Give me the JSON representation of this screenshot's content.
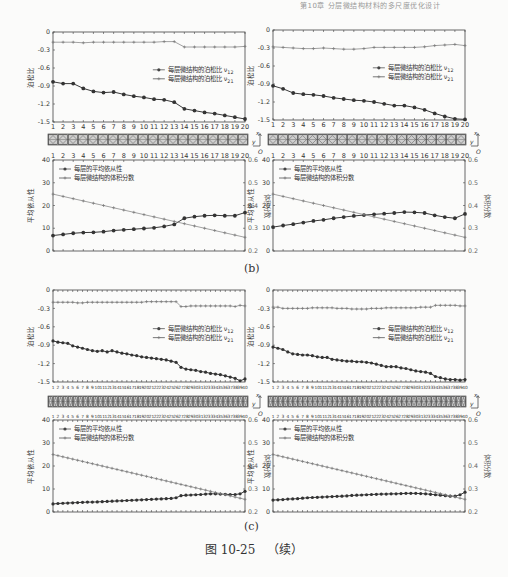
{
  "header": {
    "running_head": "第10章 分层微结构材料的多尺度优化设计"
  },
  "panels": [
    {
      "id": "b",
      "label": "(b)"
    },
    {
      "id": "c",
      "label": "(c)"
    }
  ],
  "caption": {
    "figure_number": "图 10-25",
    "suffix": "（续）"
  },
  "legend": {
    "poisson_v12": "每层微结构的泊松比 ν",
    "poisson_v12_sub": "12",
    "poisson_v21": "每层微结构的泊松比 ν",
    "poisson_v21_sub": "21",
    "avg_compliance": "每层的平均依从性",
    "volume_fraction": "每层微结构的体积分数"
  },
  "axis_labels": {
    "poisson": "泊松比",
    "compliance": "平均依从性",
    "volume": "体积分数"
  },
  "chart_data": [
    {
      "panel": "b-left-top",
      "type": "line",
      "title": "",
      "xlabel": "",
      "ylabel": "泊松比",
      "x": [
        1,
        2,
        3,
        4,
        5,
        6,
        7,
        8,
        9,
        10,
        11,
        12,
        13,
        14,
        15,
        16,
        17,
        18,
        19,
        20
      ],
      "ylim": [
        -1.5,
        0
      ],
      "yticks": [
        0,
        -0.3,
        -0.6,
        -0.9,
        -1.2,
        -1.5
      ],
      "series": [
        {
          "name": "每层微结构的泊松比 ν12",
          "marker": "filled-circle",
          "values": [
            -0.83,
            -0.86,
            -0.86,
            -0.94,
            -0.99,
            -1.01,
            -1.0,
            -1.04,
            -1.07,
            -1.09,
            -1.12,
            -1.13,
            -1.17,
            -1.28,
            -1.31,
            -1.34,
            -1.36,
            -1.39,
            -1.42,
            -1.45
          ]
        },
        {
          "name": "每层微结构的泊松比 ν21",
          "marker": "plus",
          "values": [
            -0.17,
            -0.17,
            -0.17,
            -0.18,
            -0.17,
            -0.17,
            -0.17,
            -0.17,
            -0.17,
            -0.17,
            -0.17,
            -0.16,
            -0.16,
            -0.25,
            -0.25,
            -0.25,
            -0.25,
            -0.25,
            -0.25,
            -0.24
          ]
        }
      ],
      "legend_position": "center-right"
    },
    {
      "panel": "b-right-top",
      "type": "line",
      "xlabel": "",
      "ylabel": "泊松比",
      "x": [
        1,
        2,
        3,
        4,
        5,
        6,
        7,
        8,
        9,
        10,
        11,
        12,
        13,
        14,
        15,
        16,
        17,
        18,
        19,
        20
      ],
      "ylim": [
        -1.5,
        0
      ],
      "yticks": [
        0,
        -0.3,
        -0.6,
        -0.9,
        -1.2,
        -1.5
      ],
      "series": [
        {
          "name": "每层微结构的泊松比 ν12",
          "marker": "filled-circle",
          "values": [
            -0.93,
            -0.98,
            -1.05,
            -1.07,
            -1.08,
            -1.1,
            -1.13,
            -1.15,
            -1.17,
            -1.18,
            -1.2,
            -1.23,
            -1.26,
            -1.26,
            -1.29,
            -1.33,
            -1.39,
            -1.44,
            -1.48,
            -1.49
          ]
        },
        {
          "name": "每层微结构的泊松比 ν21",
          "marker": "plus",
          "values": [
            -0.28,
            -0.29,
            -0.3,
            -0.31,
            -0.31,
            -0.3,
            -0.31,
            -0.32,
            -0.32,
            -0.31,
            -0.29,
            -0.29,
            -0.29,
            -0.29,
            -0.29,
            -0.28,
            -0.26,
            -0.25,
            -0.24,
            -0.26
          ]
        }
      ],
      "legend_position": "center-right"
    },
    {
      "panel": "b-left-bottom",
      "type": "line",
      "x": [
        1,
        2,
        3,
        4,
        5,
        6,
        7,
        8,
        9,
        10,
        11,
        12,
        13,
        14,
        15,
        16,
        17,
        18,
        19,
        20
      ],
      "ylabel": "平均依从性",
      "ylabel_right": "体积分数",
      "ylim": [
        0,
        40
      ],
      "yticks": [
        0,
        10,
        20,
        30,
        40
      ],
      "ylim_right": [
        0.2,
        0.6
      ],
      "yticks_right": [
        0.2,
        0.3,
        0.4,
        0.5,
        0.6
      ],
      "series": [
        {
          "name": "每层的平均依从性",
          "axis": "left",
          "marker": "filled-circle",
          "values": [
            6.8,
            7.3,
            7.8,
            8.1,
            8.2,
            8.5,
            9.0,
            9.3,
            9.6,
            9.9,
            10.2,
            10.8,
            11.7,
            14.4,
            15.1,
            15.5,
            15.7,
            15.5,
            15.5,
            16.9
          ]
        },
        {
          "name": "每层微结构的体积分数",
          "axis": "right",
          "marker": "plus",
          "values": [
            0.45,
            0.44,
            0.43,
            0.42,
            0.41,
            0.4,
            0.39,
            0.38,
            0.37,
            0.36,
            0.35,
            0.34,
            0.33,
            0.32,
            0.31,
            0.3,
            0.29,
            0.28,
            0.27,
            0.26
          ]
        }
      ],
      "legend_position": "upper-left"
    },
    {
      "panel": "b-right-bottom",
      "type": "line",
      "x": [
        1,
        2,
        3,
        4,
        5,
        6,
        7,
        8,
        9,
        10,
        11,
        12,
        13,
        14,
        15,
        16,
        17,
        18,
        19,
        20
      ],
      "ylabel": "平均依从性",
      "ylabel_right": "体积分数",
      "ylim": [
        0,
        40
      ],
      "yticks": [
        0,
        10,
        20,
        30,
        40
      ],
      "ylim_right": [
        0.2,
        0.6
      ],
      "yticks_right": [
        0.2,
        0.3,
        0.4,
        0.5,
        0.6
      ],
      "series": [
        {
          "name": "每层的平均依从性",
          "axis": "left",
          "marker": "filled-circle",
          "values": [
            10.5,
            11.2,
            11.8,
            12.5,
            13.2,
            13.7,
            14.4,
            14.9,
            15.4,
            15.8,
            16.1,
            16.4,
            16.7,
            17.1,
            17.0,
            16.7,
            15.7,
            14.9,
            14.4,
            16.3
          ]
        },
        {
          "name": "每层微结构的体积分数",
          "axis": "right",
          "marker": "plus",
          "values": [
            0.45,
            0.44,
            0.43,
            0.42,
            0.41,
            0.4,
            0.39,
            0.38,
            0.37,
            0.36,
            0.35,
            0.34,
            0.33,
            0.32,
            0.31,
            0.3,
            0.29,
            0.28,
            0.27,
            0.26
          ]
        }
      ],
      "legend_position": "upper-left"
    },
    {
      "panel": "c-left-top",
      "type": "line",
      "xlabel": "",
      "ylabel": "泊松比",
      "x": [
        1,
        2,
        3,
        4,
        5,
        6,
        7,
        8,
        9,
        10,
        11,
        12,
        13,
        14,
        15,
        16,
        17,
        18,
        19,
        20,
        21,
        22,
        23,
        24,
        25,
        26,
        27,
        28,
        29,
        30,
        31,
        32,
        33,
        34,
        35,
        36,
        37,
        38,
        39,
        40
      ],
      "ylim": [
        -1.5,
        0
      ],
      "yticks": [
        0,
        -0.3,
        -0.6,
        -0.9,
        -1.2,
        -1.5
      ],
      "series": [
        {
          "name": "每层微结构的泊松比 ν12",
          "marker": "filled-circle",
          "values": [
            -0.83,
            -0.85,
            -0.86,
            -0.87,
            -0.91,
            -0.93,
            -0.95,
            -0.97,
            -0.99,
            -1.0,
            -0.99,
            -1.01,
            -0.99,
            -1.01,
            -1.03,
            -1.04,
            -1.06,
            -1.07,
            -1.09,
            -1.1,
            -1.11,
            -1.12,
            -1.13,
            -1.14,
            -1.16,
            -1.18,
            -1.26,
            -1.29,
            -1.3,
            -1.31,
            -1.33,
            -1.34,
            -1.36,
            -1.37,
            -1.38,
            -1.4,
            -1.42,
            -1.44,
            -1.48,
            -1.45
          ]
        },
        {
          "name": "每层微结构的泊松比 ν21",
          "marker": "plus",
          "values": [
            -0.2,
            -0.2,
            -0.2,
            -0.2,
            -0.2,
            -0.21,
            -0.21,
            -0.2,
            -0.2,
            -0.2,
            -0.2,
            -0.2,
            -0.2,
            -0.2,
            -0.2,
            -0.2,
            -0.2,
            -0.2,
            -0.2,
            -0.19,
            -0.19,
            -0.19,
            -0.19,
            -0.19,
            -0.19,
            -0.19,
            -0.27,
            -0.27,
            -0.26,
            -0.26,
            -0.26,
            -0.26,
            -0.26,
            -0.26,
            -0.26,
            -0.26,
            -0.26,
            -0.27,
            -0.25,
            -0.26
          ]
        }
      ],
      "legend_position": "center-right"
    },
    {
      "panel": "c-right-top",
      "type": "line",
      "xlabel": "",
      "ylabel": "泊松比",
      "x": [
        1,
        2,
        3,
        4,
        5,
        6,
        7,
        8,
        9,
        10,
        11,
        12,
        13,
        14,
        15,
        16,
        17,
        18,
        19,
        20,
        21,
        22,
        23,
        24,
        25,
        26,
        27,
        28,
        29,
        30,
        31,
        32,
        33,
        34,
        35,
        36,
        37,
        38,
        39,
        40
      ],
      "ylim": [
        -1.5,
        0
      ],
      "yticks": [
        0,
        -0.3,
        -0.6,
        -0.9,
        -1.2,
        -1.5
      ],
      "series": [
        {
          "name": "每层微结构的泊松比 ν12",
          "marker": "filled-circle",
          "values": [
            -0.93,
            -0.95,
            -0.97,
            -1.01,
            -1.04,
            -1.05,
            -1.06,
            -1.06,
            -1.07,
            -1.09,
            -1.1,
            -1.1,
            -1.13,
            -1.14,
            -1.15,
            -1.16,
            -1.16,
            -1.17,
            -1.17,
            -1.18,
            -1.19,
            -1.21,
            -1.23,
            -1.25,
            -1.25,
            -1.25,
            -1.27,
            -1.28,
            -1.3,
            -1.32,
            -1.33,
            -1.34,
            -1.36,
            -1.41,
            -1.43,
            -1.45,
            -1.46,
            -1.46,
            -1.47,
            -1.46
          ]
        },
        {
          "name": "每层微结构的泊松比 ν21",
          "marker": "plus",
          "values": [
            -0.28,
            -0.28,
            -0.3,
            -0.3,
            -0.3,
            -0.3,
            -0.3,
            -0.3,
            -0.29,
            -0.29,
            -0.29,
            -0.29,
            -0.29,
            -0.3,
            -0.3,
            -0.3,
            -0.31,
            -0.31,
            -0.31,
            -0.31,
            -0.3,
            -0.3,
            -0.3,
            -0.29,
            -0.29,
            -0.29,
            -0.29,
            -0.29,
            -0.29,
            -0.29,
            -0.28,
            -0.28,
            -0.28,
            -0.25,
            -0.25,
            -0.25,
            -0.25,
            -0.25,
            -0.26,
            -0.26
          ]
        }
      ],
      "legend_position": "center-right"
    },
    {
      "panel": "c-left-bottom",
      "type": "line",
      "x": [
        1,
        2,
        3,
        4,
        5,
        6,
        7,
        8,
        9,
        10,
        11,
        12,
        13,
        14,
        15,
        16,
        17,
        18,
        19,
        20,
        21,
        22,
        23,
        24,
        25,
        26,
        27,
        28,
        29,
        30,
        31,
        32,
        33,
        34,
        35,
        36,
        37,
        38,
        39,
        40
      ],
      "ylabel": "平均依从性",
      "ylabel_right": "体积分数",
      "ylim": [
        0,
        40
      ],
      "yticks": [
        0,
        10,
        20,
        30,
        40
      ],
      "ylim_right": [
        0.2,
        0.6
      ],
      "yticks_right": [
        0.2,
        0.3,
        0.4,
        0.5,
        0.6
      ],
      "series": [
        {
          "name": "每层的平均依从性",
          "axis": "left",
          "marker": "filled-circle",
          "values": [
            3.5,
            3.7,
            3.8,
            3.9,
            4.0,
            4.1,
            4.2,
            4.3,
            4.3,
            4.4,
            4.5,
            4.6,
            4.7,
            4.8,
            4.9,
            5.0,
            5.1,
            5.2,
            5.3,
            5.4,
            5.5,
            5.6,
            5.7,
            5.8,
            5.9,
            6.2,
            7.1,
            7.3,
            7.4,
            7.5,
            7.6,
            7.8,
            7.9,
            7.9,
            7.8,
            7.7,
            7.6,
            7.6,
            7.9,
            9.0
          ]
        },
        {
          "name": "每层微结构的体积分数",
          "axis": "right",
          "marker": "plus",
          "values": [
            0.45,
            0.445,
            0.44,
            0.435,
            0.43,
            0.425,
            0.42,
            0.415,
            0.41,
            0.405,
            0.4,
            0.395,
            0.39,
            0.385,
            0.38,
            0.375,
            0.37,
            0.365,
            0.36,
            0.355,
            0.35,
            0.345,
            0.34,
            0.335,
            0.33,
            0.325,
            0.32,
            0.315,
            0.31,
            0.305,
            0.3,
            0.295,
            0.29,
            0.285,
            0.28,
            0.275,
            0.27,
            0.265,
            0.26,
            0.255
          ]
        }
      ],
      "legend_position": "upper-left"
    },
    {
      "panel": "c-right-bottom",
      "type": "line",
      "x": [
        1,
        2,
        3,
        4,
        5,
        6,
        7,
        8,
        9,
        10,
        11,
        12,
        13,
        14,
        15,
        16,
        17,
        18,
        19,
        20,
        21,
        22,
        23,
        24,
        25,
        26,
        27,
        28,
        29,
        30,
        31,
        32,
        33,
        34,
        35,
        36,
        37,
        38,
        39,
        40
      ],
      "ylabel": "平均依从性",
      "ylabel_right": "体积分数",
      "ylim": [
        0,
        40
      ],
      "yticks": [
        0,
        10,
        20,
        30,
        40
      ],
      "ylim_right": [
        0.2,
        0.6
      ],
      "yticks_right": [
        0.2,
        0.3,
        0.4,
        0.5,
        0.6
      ],
      "series": [
        {
          "name": "每层的平均依从性",
          "axis": "left",
          "marker": "filled-circle",
          "values": [
            5.2,
            5.3,
            5.4,
            5.6,
            5.7,
            5.8,
            6.0,
            6.2,
            6.3,
            6.4,
            6.5,
            6.6,
            6.7,
            6.8,
            6.9,
            7.0,
            7.2,
            7.3,
            7.4,
            7.5,
            7.6,
            7.7,
            7.8,
            7.8,
            7.9,
            7.9,
            8.0,
            8.1,
            8.1,
            8.1,
            8.0,
            7.9,
            7.7,
            7.5,
            7.3,
            7.1,
            6.9,
            6.9,
            7.5,
            8.6
          ]
        },
        {
          "name": "每层微结构的体积分数",
          "axis": "right",
          "marker": "plus",
          "values": [
            0.45,
            0.445,
            0.44,
            0.435,
            0.43,
            0.425,
            0.42,
            0.415,
            0.41,
            0.405,
            0.4,
            0.395,
            0.39,
            0.385,
            0.38,
            0.375,
            0.37,
            0.365,
            0.36,
            0.355,
            0.35,
            0.345,
            0.34,
            0.335,
            0.33,
            0.325,
            0.32,
            0.315,
            0.31,
            0.305,
            0.3,
            0.295,
            0.29,
            0.285,
            0.28,
            0.275,
            0.27,
            0.265,
            0.26,
            0.255
          ]
        }
      ],
      "legend_position": "upper-left"
    }
  ]
}
